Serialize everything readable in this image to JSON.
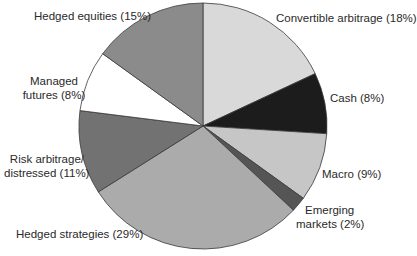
{
  "chart_data": {
    "type": "pie",
    "title": "",
    "start_angle_deg": 0,
    "direction": "clockwise",
    "slices": [
      {
        "label": "Convertible arbitrage",
        "value": 18,
        "display": "Convertible arbitrage (18%)",
        "color": "#d9d9d9"
      },
      {
        "label": "Cash",
        "value": 8,
        "display": "Cash (8%)",
        "color": "#1c1c1c"
      },
      {
        "label": "Macro",
        "value": 9,
        "display": "Macro (9%)",
        "color": "#c6c6c6"
      },
      {
        "label": "Emerging markets",
        "value": 2,
        "display": "Emerging markets (2%)",
        "color": "#555555"
      },
      {
        "label": "Hedged strategies",
        "value": 29,
        "display": "Hedged strategies (29%)",
        "color": "#ababab"
      },
      {
        "label": "Risk arbitrage/distressed",
        "value": 11,
        "display": "Risk arbitrage/distressed (11%)",
        "color": "#727272"
      },
      {
        "label": "Managed futures",
        "value": 8,
        "display": "Managed futures (8%)",
        "color": "#ffffff"
      },
      {
        "label": "Hedged equities",
        "value": 15,
        "display": "Hedged equities (15%)",
        "color": "#8b8b8b"
      }
    ],
    "legend": "none (direct labels)"
  },
  "labels": {
    "convertible": "Convertible arbitrage (18%)",
    "cash": "Cash (8%)",
    "macro": "Macro (9%)",
    "emerging_1": "Emerging",
    "emerging_2": "markets (2%)",
    "hedged_strategies": "Hedged strategies (29%)",
    "risk_1": "Risk arbitrage/",
    "risk_2": "distressed (11%)",
    "managed_1": "Managed",
    "managed_2": "futures (8%)",
    "hedged_equities": "Hedged equities (15%)"
  }
}
